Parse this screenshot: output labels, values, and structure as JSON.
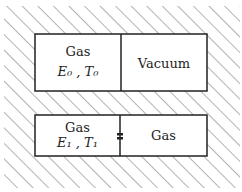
{
  "top_container": {
    "left": {
      "title": "Gas",
      "vars": "E₀ , T₀"
    },
    "right": {
      "title": "Vacuum"
    }
  },
  "bottom_container": {
    "left": {
      "title": "Gas",
      "vars": "E₁ , T₁"
    },
    "right": {
      "title": "Gas"
    },
    "divider": "valve"
  },
  "colors": {
    "line": "#222222",
    "hatch": "#555555",
    "background": "#ffffff"
  }
}
